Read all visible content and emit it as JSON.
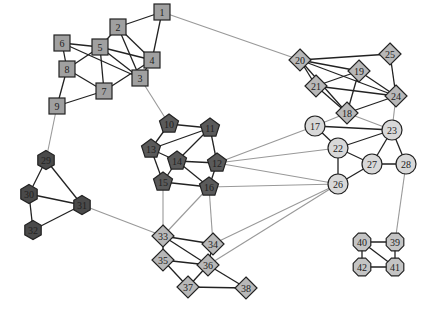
{
  "diagram": {
    "type": "network-graph",
    "colors": {
      "square_fill": "#a0a0a0",
      "pentagon_fill": "#5a5a5a",
      "hexagon_dark_fill": "#4a4a4a",
      "diamond_fill": "#b8b8b8",
      "circle_fill": "#d8d8d8",
      "octagon_fill": "#c4c4c4",
      "intra_edge": "#222222",
      "inter_edge": "#999999",
      "node_stroke": "#222222"
    },
    "nodes": [
      {
        "id": "1",
        "x": 162,
        "y": 12,
        "shape": "square",
        "fill": "#a0a0a0"
      },
      {
        "id": "2",
        "x": 118,
        "y": 27,
        "shape": "square",
        "fill": "#a0a0a0"
      },
      {
        "id": "3",
        "x": 140,
        "y": 78,
        "shape": "square",
        "fill": "#a0a0a0"
      },
      {
        "id": "4",
        "x": 152,
        "y": 60,
        "shape": "square",
        "fill": "#a0a0a0"
      },
      {
        "id": "5",
        "x": 100,
        "y": 47,
        "shape": "square",
        "fill": "#a0a0a0"
      },
      {
        "id": "6",
        "x": 62,
        "y": 43,
        "shape": "square",
        "fill": "#a0a0a0"
      },
      {
        "id": "7",
        "x": 104,
        "y": 91,
        "shape": "square",
        "fill": "#a0a0a0"
      },
      {
        "id": "8",
        "x": 67,
        "y": 69,
        "shape": "square",
        "fill": "#a0a0a0"
      },
      {
        "id": "9",
        "x": 57,
        "y": 106,
        "shape": "square",
        "fill": "#a0a0a0"
      },
      {
        "id": "10",
        "x": 169,
        "y": 124,
        "shape": "pentagon",
        "fill": "#5a5a5a"
      },
      {
        "id": "11",
        "x": 210,
        "y": 128,
        "shape": "pentagon",
        "fill": "#5a5a5a"
      },
      {
        "id": "12",
        "x": 217,
        "y": 163,
        "shape": "pentagon",
        "fill": "#5a5a5a"
      },
      {
        "id": "13",
        "x": 151,
        "y": 149,
        "shape": "pentagon",
        "fill": "#5a5a5a"
      },
      {
        "id": "14",
        "x": 177,
        "y": 161,
        "shape": "pentagon",
        "fill": "#5a5a5a"
      },
      {
        "id": "15",
        "x": 163,
        "y": 182,
        "shape": "pentagon",
        "fill": "#5a5a5a"
      },
      {
        "id": "16",
        "x": 209,
        "y": 187,
        "shape": "pentagon",
        "fill": "#5a5a5a"
      },
      {
        "id": "17",
        "x": 315,
        "y": 126,
        "shape": "circle",
        "fill": "#d8d8d8"
      },
      {
        "id": "18",
        "x": 347,
        "y": 113,
        "shape": "diamond",
        "fill": "#b8b8b8"
      },
      {
        "id": "19",
        "x": 359,
        "y": 71,
        "shape": "diamond",
        "fill": "#b8b8b8"
      },
      {
        "id": "20",
        "x": 300,
        "y": 60,
        "shape": "diamond",
        "fill": "#b8b8b8"
      },
      {
        "id": "21",
        "x": 316,
        "y": 86,
        "shape": "diamond",
        "fill": "#b8b8b8"
      },
      {
        "id": "22",
        "x": 338,
        "y": 148,
        "shape": "circle",
        "fill": "#d8d8d8"
      },
      {
        "id": "23",
        "x": 392,
        "y": 130,
        "shape": "circle",
        "fill": "#d8d8d8"
      },
      {
        "id": "24",
        "x": 396,
        "y": 96,
        "shape": "diamond",
        "fill": "#b8b8b8"
      },
      {
        "id": "25",
        "x": 390,
        "y": 54,
        "shape": "diamond",
        "fill": "#b8b8b8"
      },
      {
        "id": "26",
        "x": 338,
        "y": 184,
        "shape": "circle",
        "fill": "#d8d8d8"
      },
      {
        "id": "27",
        "x": 372,
        "y": 164,
        "shape": "circle",
        "fill": "#d8d8d8"
      },
      {
        "id": "28",
        "x": 406,
        "y": 164,
        "shape": "circle",
        "fill": "#d8d8d8"
      },
      {
        "id": "29",
        "x": 46,
        "y": 160,
        "shape": "hexagon",
        "fill": "#4a4a4a"
      },
      {
        "id": "30",
        "x": 29,
        "y": 194,
        "shape": "hexagon",
        "fill": "#4a4a4a"
      },
      {
        "id": "31",
        "x": 82,
        "y": 205,
        "shape": "hexagon",
        "fill": "#4a4a4a"
      },
      {
        "id": "32",
        "x": 33,
        "y": 230,
        "shape": "hexagon",
        "fill": "#4a4a4a"
      },
      {
        "id": "33",
        "x": 163,
        "y": 236,
        "shape": "diamond",
        "fill": "#b8b8b8"
      },
      {
        "id": "34",
        "x": 213,
        "y": 244,
        "shape": "diamond",
        "fill": "#b8b8b8"
      },
      {
        "id": "35",
        "x": 163,
        "y": 260,
        "shape": "diamond",
        "fill": "#b8b8b8"
      },
      {
        "id": "36",
        "x": 208,
        "y": 265,
        "shape": "diamond",
        "fill": "#b8b8b8"
      },
      {
        "id": "37",
        "x": 188,
        "y": 287,
        "shape": "diamond",
        "fill": "#b8b8b8"
      },
      {
        "id": "38",
        "x": 246,
        "y": 288,
        "shape": "diamond",
        "fill": "#b8b8b8"
      },
      {
        "id": "39",
        "x": 395,
        "y": 242,
        "shape": "octagon",
        "fill": "#c4c4c4"
      },
      {
        "id": "40",
        "x": 362,
        "y": 242,
        "shape": "octagon",
        "fill": "#c4c4c4"
      },
      {
        "id": "41",
        "x": 395,
        "y": 267,
        "shape": "octagon",
        "fill": "#c4c4c4"
      },
      {
        "id": "42",
        "x": 362,
        "y": 267,
        "shape": "octagon",
        "fill": "#c4c4c4"
      }
    ],
    "edges": [
      [
        "1",
        "2",
        "intra"
      ],
      [
        "1",
        "4",
        "intra"
      ],
      [
        "2",
        "4",
        "intra"
      ],
      [
        "2",
        "3",
        "intra"
      ],
      [
        "2",
        "5",
        "intra"
      ],
      [
        "5",
        "4",
        "intra"
      ],
      [
        "5",
        "3",
        "intra"
      ],
      [
        "5",
        "7",
        "intra"
      ],
      [
        "5",
        "8",
        "intra"
      ],
      [
        "6",
        "5",
        "intra"
      ],
      [
        "6",
        "8",
        "intra"
      ],
      [
        "6",
        "3",
        "intra"
      ],
      [
        "8",
        "7",
        "intra"
      ],
      [
        "8",
        "9",
        "intra"
      ],
      [
        "9",
        "7",
        "intra"
      ],
      [
        "7",
        "4",
        "intra"
      ],
      [
        "4",
        "3",
        "intra"
      ],
      [
        "10",
        "11",
        "intra"
      ],
      [
        "10",
        "13",
        "intra"
      ],
      [
        "13",
        "11",
        "intra"
      ],
      [
        "13",
        "14",
        "intra"
      ],
      [
        "13",
        "15",
        "intra"
      ],
      [
        "14",
        "11",
        "intra"
      ],
      [
        "14",
        "12",
        "intra"
      ],
      [
        "14",
        "15",
        "intra"
      ],
      [
        "14",
        "16",
        "intra"
      ],
      [
        "11",
        "12",
        "intra"
      ],
      [
        "12",
        "16",
        "intra"
      ],
      [
        "15",
        "16",
        "intra"
      ],
      [
        "20",
        "25",
        "intra"
      ],
      [
        "20",
        "19",
        "intra"
      ],
      [
        "20",
        "21",
        "intra"
      ],
      [
        "20",
        "24",
        "intra"
      ],
      [
        "20",
        "18",
        "intra"
      ],
      [
        "21",
        "19",
        "intra"
      ],
      [
        "21",
        "24",
        "intra"
      ],
      [
        "21",
        "18",
        "intra"
      ],
      [
        "19",
        "18",
        "intra"
      ],
      [
        "19",
        "24",
        "intra"
      ],
      [
        "25",
        "24",
        "intra"
      ],
      [
        "18",
        "24",
        "intra"
      ],
      [
        "17",
        "23",
        "intra"
      ],
      [
        "17",
        "22",
        "intra"
      ],
      [
        "22",
        "23",
        "intra"
      ],
      [
        "22",
        "27",
        "intra"
      ],
      [
        "22",
        "26",
        "intra"
      ],
      [
        "23",
        "27",
        "intra"
      ],
      [
        "23",
        "28",
        "intra"
      ],
      [
        "27",
        "28",
        "intra"
      ],
      [
        "27",
        "26",
        "intra"
      ],
      [
        "29",
        "30",
        "intra"
      ],
      [
        "29",
        "31",
        "intra"
      ],
      [
        "30",
        "31",
        "intra"
      ],
      [
        "30",
        "32",
        "intra"
      ],
      [
        "32",
        "31",
        "intra"
      ],
      [
        "33",
        "34",
        "intra"
      ],
      [
        "33",
        "35",
        "intra"
      ],
      [
        "33",
        "36",
        "intra"
      ],
      [
        "35",
        "36",
        "intra"
      ],
      [
        "35",
        "37",
        "intra"
      ],
      [
        "36",
        "37",
        "intra"
      ],
      [
        "36",
        "38",
        "intra"
      ],
      [
        "37",
        "38",
        "intra"
      ],
      [
        "34",
        "36",
        "intra"
      ],
      [
        "40",
        "39",
        "intra"
      ],
      [
        "40",
        "42",
        "intra"
      ],
      [
        "40",
        "41",
        "intra"
      ],
      [
        "39",
        "41",
        "intra"
      ],
      [
        "42",
        "41",
        "intra"
      ],
      [
        "1",
        "20",
        "inter"
      ],
      [
        "3",
        "10",
        "inter"
      ],
      [
        "9",
        "29",
        "inter"
      ],
      [
        "31",
        "33",
        "inter"
      ],
      [
        "12",
        "17",
        "inter"
      ],
      [
        "12",
        "22",
        "inter"
      ],
      [
        "12",
        "26",
        "inter"
      ],
      [
        "16",
        "26",
        "inter"
      ],
      [
        "15",
        "33",
        "inter"
      ],
      [
        "16",
        "33",
        "inter"
      ],
      [
        "16",
        "34",
        "inter"
      ],
      [
        "26",
        "34",
        "inter"
      ],
      [
        "26",
        "36",
        "inter"
      ],
      [
        "18",
        "17",
        "inter"
      ],
      [
        "18",
        "23",
        "inter"
      ],
      [
        "24",
        "23",
        "inter"
      ],
      [
        "28",
        "39",
        "inter"
      ]
    ]
  }
}
